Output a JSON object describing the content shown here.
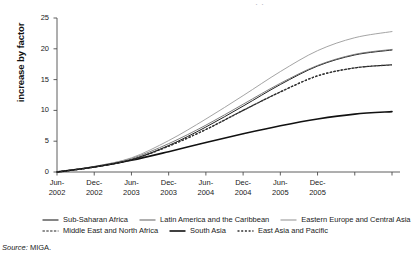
{
  "figure": {
    "title_sliver": "· ·",
    "source_prefix": "Source:",
    "source_text": "MIGA."
  },
  "chart_data": {
    "type": "line",
    "title": "",
    "xlabel": "",
    "ylabel": "increase by factor",
    "ylim": [
      0,
      25
    ],
    "yticks": [
      0,
      5,
      10,
      15,
      20,
      25
    ],
    "grid": false,
    "legend_position": "bottom",
    "x_tick_labels": [
      [
        "Jun-",
        "2002"
      ],
      [
        "Dec-",
        "2002"
      ],
      [
        "Jun-",
        "2003"
      ],
      [
        "Dec-",
        "2003"
      ],
      [
        "Jun-",
        "2004"
      ],
      [
        "Dec-",
        "2004"
      ],
      [
        "Jun-",
        "2005"
      ],
      [
        "Dec-",
        "2005"
      ]
    ],
    "x": [
      "Jun-2002",
      "Dec-2002",
      "Jun-2003",
      "Dec-2003",
      "Jun-2004",
      "Dec-2004",
      "Jun-2005",
      "Dec-2005",
      "Jun-2006",
      "Dec-2006"
    ],
    "series": [
      {
        "name": "Sub-Saharan Africa",
        "style": "solid",
        "color": "#222222",
        "width": 1.0,
        "values": [
          0,
          0.8,
          2.0,
          4.3,
          7.3,
          10.7,
          14.2,
          17.2,
          19.0,
          19.8
        ]
      },
      {
        "name": "Latin America and the Caribbean",
        "style": "solid",
        "color": "#6e6e6e",
        "width": 0.9,
        "values": [
          0,
          0.9,
          2.2,
          4.6,
          7.6,
          11.0,
          14.4,
          17.3,
          19.1,
          19.9
        ]
      },
      {
        "name": "Eastern Europe and Central Asia",
        "style": "solid",
        "color": "#9a9a9a",
        "width": 0.9,
        "values": [
          0,
          0.9,
          2.3,
          5.1,
          8.6,
          12.4,
          16.3,
          19.7,
          21.8,
          22.8
        ]
      },
      {
        "name": "Middle East and North Africa",
        "style": "dashed",
        "color": "#222222",
        "width": 1.2,
        "values": [
          0,
          0.8,
          2.0,
          4.2,
          6.9,
          10.0,
          13.0,
          15.6,
          16.9,
          17.4
        ]
      },
      {
        "name": "South Asia",
        "style": "solid",
        "color": "#111111",
        "width": 1.6,
        "values": [
          0,
          0.8,
          1.9,
          3.3,
          4.8,
          6.2,
          7.5,
          8.6,
          9.4,
          9.8
        ]
      },
      {
        "name": "East Asia and Pacific",
        "style": "dotted",
        "color": "#333333",
        "width": 1.3,
        "values": [
          0,
          0.8,
          2.0,
          4.2,
          6.9,
          10.0,
          13.0,
          15.6,
          16.9,
          17.4
        ]
      }
    ]
  }
}
